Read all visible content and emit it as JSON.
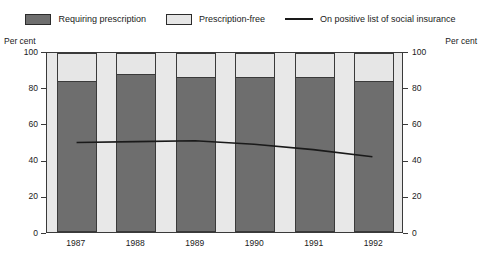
{
  "legend": {
    "items": [
      {
        "label": "Requiring prescription",
        "marker": "swatch",
        "color": "#6e6e6e",
        "name": "legend-requiring-prescription"
      },
      {
        "label": "Prescription-free",
        "marker": "swatch",
        "color": "#e6e6e6",
        "name": "legend-prescription-free"
      },
      {
        "label": "On positive list of social insurance",
        "marker": "line",
        "color": "#1a1a1a",
        "name": "legend-positive-list"
      }
    ]
  },
  "axis_caption_left": "Per cent",
  "axis_caption_right": "Per cent",
  "chart_data": {
    "type": "bar",
    "title": "",
    "subtitle": "",
    "xlabel": "",
    "ylabel": "Per cent",
    "ylabel_right": "Per cent",
    "categories": [
      "1987",
      "1988",
      "1989",
      "1990",
      "1991",
      "1992"
    ],
    "ylim": [
      0,
      100
    ],
    "yticks": [
      0,
      20,
      40,
      60,
      80,
      100
    ],
    "ytick_labels": [
      "0",
      "20",
      "40",
      "60",
      "80",
      "100"
    ],
    "grid": false,
    "legend_position": "top",
    "stacked": true,
    "series": [
      {
        "name": "Requiring prescription",
        "type": "bar",
        "color": "#6e6e6e",
        "values": [
          83,
          87,
          85,
          85,
          85,
          83
        ]
      },
      {
        "name": "Prescription-free",
        "type": "bar",
        "color": "#e6e6e6",
        "values": [
          17,
          13,
          15,
          15,
          15,
          17
        ]
      },
      {
        "name": "On positive list of social insurance",
        "type": "line",
        "color": "#1a1a1a",
        "values": [
          50,
          50.5,
          51,
          49,
          46,
          42
        ]
      }
    ]
  }
}
